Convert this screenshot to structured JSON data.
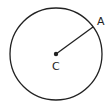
{
  "diagram": {
    "type": "circle-with-radius",
    "circle": {
      "cx": 56,
      "cy": 54,
      "r": 46
    },
    "center_point": {
      "label": "C",
      "x": 56,
      "y": 54
    },
    "radius_point": {
      "label": "A",
      "x": 93,
      "y": 27
    },
    "stroke_color": "#222222"
  }
}
